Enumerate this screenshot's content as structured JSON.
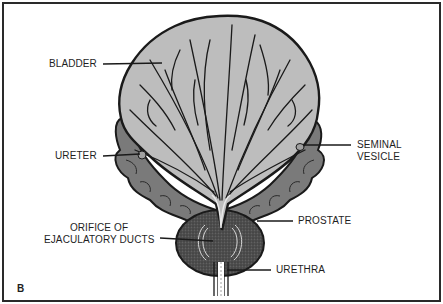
{
  "figure": {
    "panel_letter": "B",
    "colors": {
      "bladder_fill": "#bdbdbd",
      "seminal_vesicle_fill": "#7a7a7a",
      "prostate_fill": "#4a4a4a",
      "outline": "#1a1a1a",
      "background": "#ffffff",
      "text": "#1e1e1e"
    },
    "labels": {
      "bladder": "BLADDER",
      "ureter": "URETER",
      "seminal_vesicle_line1": "SEMINAL",
      "seminal_vesicle_line2": "VESICLE",
      "prostate": "PROSTATE",
      "orifice_line1": "ORIFICE OF",
      "orifice_line2": "EJACULATORY DUCTS",
      "urethra": "URETHRA"
    }
  }
}
